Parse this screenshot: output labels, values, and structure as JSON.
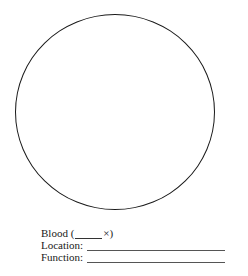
{
  "figure": {
    "shape": "circle"
  },
  "form": {
    "specimen_label": "Blood (",
    "magnification_suffix": "×)",
    "magnification_value": "",
    "location_label": "Location:",
    "location_value": "",
    "function_label": "Function:",
    "function_value": ""
  }
}
